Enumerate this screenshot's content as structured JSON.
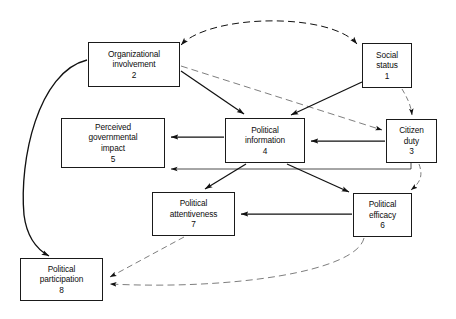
{
  "diagram": {
    "caption_fragment": "",
    "line_color": "#111111",
    "box_border_color": "#1a1a1a",
    "background": "#ffffff",
    "nodes": [
      {
        "id": "n2",
        "label": "Organizational\ninvolvement",
        "number": "2",
        "x": 88,
        "y": 42,
        "w": 92,
        "h": 45
      },
      {
        "id": "n1",
        "label": "Social\nstatus",
        "number": "1",
        "x": 362,
        "y": 43,
        "w": 50,
        "h": 45
      },
      {
        "id": "n5",
        "label": "Perceived\ngovernmental\nimpact",
        "number": "5",
        "x": 61,
        "y": 118,
        "w": 104,
        "h": 50
      },
      {
        "id": "n4",
        "label": "Political\ninformation",
        "number": "4",
        "x": 225,
        "y": 118,
        "w": 80,
        "h": 45
      },
      {
        "id": "n3",
        "label": "Citizen\nduty",
        "number": "3",
        "x": 386,
        "y": 119,
        "w": 51,
        "h": 44
      },
      {
        "id": "n7",
        "label": "Political\nattentiveness",
        "number": "7",
        "x": 152,
        "y": 192,
        "w": 83,
        "h": 44
      },
      {
        "id": "n6",
        "label": "Political\nefficacy",
        "number": "6",
        "x": 353,
        "y": 193,
        "w": 59,
        "h": 44
      },
      {
        "id": "n8",
        "label": "Political\nparticipation",
        "number": "8",
        "x": 20,
        "y": 258,
        "w": 83,
        "h": 43
      }
    ],
    "edges": [
      {
        "id": "e_2_1",
        "from": "2",
        "to": "1",
        "style": "dashed",
        "arrows": "both",
        "note": "curved correlation over the top"
      },
      {
        "id": "e_2_4",
        "from": "2",
        "to": "4",
        "style": "solid",
        "arrows": "to"
      },
      {
        "id": "e_2_3",
        "from": "2",
        "to": "3",
        "style": "dashed",
        "arrows": "to"
      },
      {
        "id": "e_2_8",
        "from": "2",
        "to": "8",
        "style": "solid",
        "arrows": "to",
        "note": "curved around the left side"
      },
      {
        "id": "e_1_4",
        "from": "1",
        "to": "4",
        "style": "solid",
        "arrows": "to"
      },
      {
        "id": "e_1_3",
        "from": "1",
        "to": "3",
        "style": "dashed",
        "arrows": "to"
      },
      {
        "id": "e_3_4",
        "from": "3",
        "to": "4",
        "style": "solid",
        "arrows": "to"
      },
      {
        "id": "e_3_5",
        "from": "3",
        "to": "5",
        "style": "solid",
        "arrows": "to",
        "note": "drops below box 4 then runs left"
      },
      {
        "id": "e_3_6",
        "from": "3",
        "to": "6",
        "style": "dashed",
        "arrows": "to"
      },
      {
        "id": "e_4_5",
        "from": "4",
        "to": "5",
        "style": "solid",
        "arrows": "to"
      },
      {
        "id": "e_4_7",
        "from": "4",
        "to": "7",
        "style": "solid",
        "arrows": "to"
      },
      {
        "id": "e_4_6",
        "from": "4",
        "to": "6",
        "style": "solid",
        "arrows": "to"
      },
      {
        "id": "e_6_7",
        "from": "6",
        "to": "7",
        "style": "solid",
        "arrows": "to"
      },
      {
        "id": "e_7_8",
        "from": "7",
        "to": "8",
        "style": "dashed",
        "arrows": "to"
      },
      {
        "id": "e_6_8",
        "from": "6",
        "to": "8",
        "style": "dashed",
        "arrows": "to",
        "note": "long curve along the bottom"
      }
    ]
  }
}
